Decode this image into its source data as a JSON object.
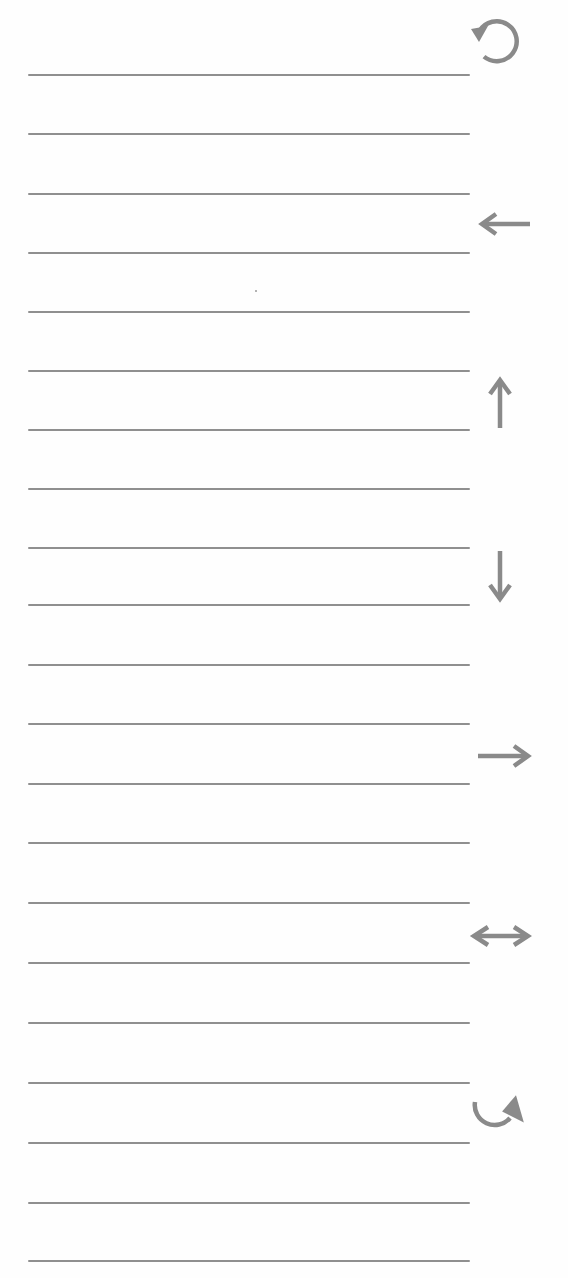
{
  "page": {
    "type": "lined-worksheet",
    "line_color": "#8f8f8f",
    "icon_color": "#8a8a8a",
    "background": "#fefefe",
    "line_count": 21,
    "line_positions_y": [
      75,
      134,
      194,
      253,
      312,
      371,
      430,
      489,
      548,
      605,
      665,
      724,
      784,
      843,
      903,
      963,
      1023,
      1083,
      1143,
      1203,
      1261
    ]
  },
  "icons": [
    {
      "name": "rotate-counterclockwise-icon",
      "glyph": "↺",
      "y": 12
    },
    {
      "name": "arrow-left-icon",
      "glyph": "←",
      "y": 192
    },
    {
      "name": "arrow-up-icon",
      "glyph": "↑",
      "y": 370
    },
    {
      "name": "arrow-down-icon",
      "glyph": "↓",
      "y": 545
    },
    {
      "name": "arrow-right-icon",
      "glyph": "→",
      "y": 724
    },
    {
      "name": "arrow-left-right-icon",
      "glyph": "↔",
      "y": 904
    },
    {
      "name": "rotate-clockwise-icon",
      "glyph": "↻",
      "y": 1082
    }
  ]
}
